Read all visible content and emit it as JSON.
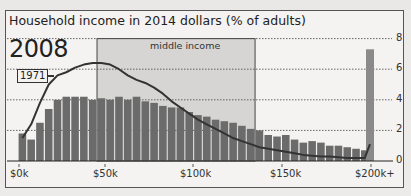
{
  "chart_data": {
    "type": "bar",
    "title": "Household income in 2014 dollars (% of adults)",
    "xlabel": "",
    "ylabel": "% of adults",
    "ylim": [
      0,
      8
    ],
    "yticks": [
      0,
      2,
      4,
      6,
      8
    ],
    "grid": true,
    "xtick_labels": [
      "$0k",
      "$50k",
      "$100k",
      "$150k",
      "$200k+"
    ],
    "annotations": {
      "year": "2008",
      "comparison_line_label": "1971",
      "shaded_region": "middle income"
    },
    "shaded_region_range_k": [
      45,
      135
    ],
    "categories": [
      "0-5k",
      "5-10k",
      "10-15k",
      "15-20k",
      "20-25k",
      "25-30k",
      "30-35k",
      "35-40k",
      "40-45k",
      "45-50k",
      "50-55k",
      "55-60k",
      "60-65k",
      "65-70k",
      "70-75k",
      "75-80k",
      "80-85k",
      "85-90k",
      "90-95k",
      "95-100k",
      "100-105k",
      "105-110k",
      "110-115k",
      "115-120k",
      "120-125k",
      "125-130k",
      "130-135k",
      "135-140k",
      "140-145k",
      "145-150k",
      "150-155k",
      "155-160k",
      "160-165k",
      "165-170k",
      "170-175k",
      "175-180k",
      "180-185k",
      "185-190k",
      "190-195k",
      "195-200k",
      "200k+"
    ],
    "series": [
      {
        "name": "2008",
        "type": "bar",
        "values": [
          1.8,
          1.4,
          2.5,
          3.4,
          4.0,
          4.2,
          4.2,
          4.2,
          4.0,
          4.1,
          4.0,
          4.2,
          4.0,
          4.2,
          3.9,
          3.8,
          3.6,
          3.5,
          3.5,
          3.2,
          3.0,
          2.9,
          2.7,
          2.6,
          2.5,
          2.3,
          2.1,
          2.0,
          1.7,
          1.6,
          1.7,
          1.4,
          1.2,
          1.3,
          1.2,
          1.0,
          1.0,
          0.9,
          0.8,
          0.7,
          7.3
        ]
      },
      {
        "name": "1971",
        "type": "line",
        "values": [
          1.5,
          2.4,
          3.8,
          5.0,
          5.6,
          5.8,
          6.1,
          6.3,
          6.4,
          6.4,
          6.3,
          6.0,
          5.6,
          5.3,
          5.1,
          4.8,
          4.4,
          3.9,
          3.5,
          3.1,
          2.7,
          2.4,
          2.1,
          1.8,
          1.5,
          1.3,
          1.1,
          0.9,
          0.8,
          0.7,
          0.6,
          0.5,
          0.4,
          0.35,
          0.3,
          0.3,
          0.25,
          0.2,
          0.2,
          0.2,
          1.1
        ]
      }
    ]
  },
  "colors": {
    "bar": "#6b6b6b",
    "bar_200k": "#8a8a8a",
    "line": "#333333",
    "middle_band": "#d6d5d3",
    "panel_bg": "#f4f3f1"
  }
}
